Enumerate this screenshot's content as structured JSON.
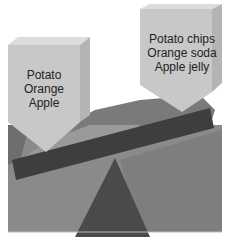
{
  "diagram": {
    "type": "seesaw-comparison",
    "left_weight": {
      "lines": [
        "Potato",
        "Orange",
        "Apple"
      ]
    },
    "right_weight": {
      "lines": [
        "Potato chips",
        "Orange soda",
        "Apple jelly"
      ]
    },
    "colors": {
      "background": "#ffffff",
      "weight_fill": "#c8c8c8",
      "weight_top": "#dcdcdc",
      "board": "#3e3e3e",
      "fulcrum": "#4a4a4a",
      "backdrop_dark": "#6e6e6e",
      "backdrop_mid": "#8a8a8a",
      "backdrop_light": "#9a9a9a"
    }
  }
}
